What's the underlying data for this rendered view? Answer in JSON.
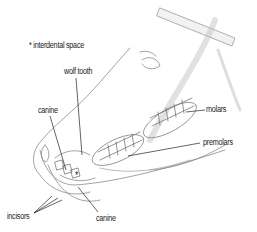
{
  "figure": {
    "legend_note": "* interdental space",
    "labels": {
      "wolf_tooth": "wolf tooth",
      "canine_upper": "canine",
      "molars": "molars",
      "premolars": "premolars",
      "incisors": "incisors",
      "canine_lower": "canine",
      "asterisk": "*"
    },
    "colors": {
      "ink": "#222222",
      "sketch": "#8a8a8a",
      "shade": "#c8c8c8"
    }
  }
}
